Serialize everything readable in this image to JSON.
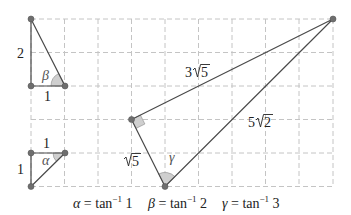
{
  "diagram": {
    "grid": {
      "x0": 31,
      "y0": 19,
      "unit": 33.5,
      "cols": 9,
      "rows": 5
    },
    "triangles": {
      "beta": {
        "legs": {
          "vertical": "2",
          "horizontal": "1"
        },
        "angle_label": "β"
      },
      "alpha": {
        "legs": {
          "vertical": "1",
          "horizontal": "1"
        },
        "angle_label": "α"
      },
      "gamma": {
        "sides": {
          "short_leg": "√5",
          "long_leg": "3√5",
          "hypotenuse": "5√2"
        },
        "long_leg_coef": "3",
        "hyp_coef": "5",
        "short_leg_rad": "5",
        "long_leg_rad": "5",
        "hyp_rad": "2",
        "angle_label": "γ"
      }
    },
    "caption": {
      "alpha": {
        "sym": "α",
        "eq": " = tan",
        "sup": "−1",
        "val": " 1"
      },
      "beta": {
        "sym": "β",
        "eq": " = tan",
        "sup": "−1",
        "val": " 2"
      },
      "gamma": {
        "sym": "γ",
        "eq": " = tan",
        "sup": "−1",
        "val": " 3"
      }
    },
    "colors": {
      "edge": "#4a4a4a",
      "point": "#6e6e6e",
      "angle_fill": "#cfcfcf",
      "grid": "#c4c4c4"
    }
  }
}
